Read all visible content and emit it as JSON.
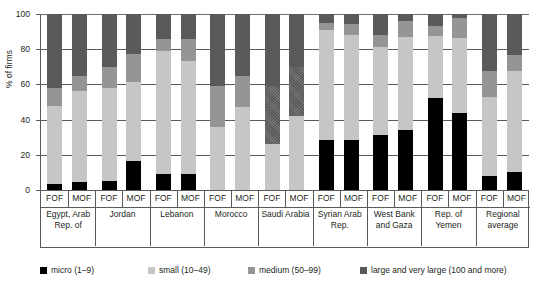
{
  "title_fragment": "...",
  "axis": {
    "ylabel": "% of firms",
    "yticks": [
      "0",
      "20",
      "40",
      "60",
      "80",
      "100"
    ],
    "ymin": 0,
    "ymax": 100
  },
  "subcategory_labels": [
    "FOF",
    "MOF"
  ],
  "legend": [
    {
      "label": "micro (1–9)",
      "color": "#000000"
    },
    {
      "label": "small (10–49)",
      "color": "#c6c6c6"
    },
    {
      "label": "medium (50–99)",
      "color": "#959595"
    },
    {
      "label": "large and very large (100 and more)",
      "color": "#5a5a5a"
    }
  ],
  "chart_data": {
    "type": "bar",
    "subtype": "stacked-grouped",
    "title": "",
    "xlabel": "",
    "ylabel": "% of firms",
    "ylim": [
      0,
      100
    ],
    "grid": true,
    "legend_position": "bottom",
    "ytick_values": [
      0,
      20,
      40,
      60,
      80,
      100
    ],
    "categories": [
      "Egypt, Arab Rep. of",
      "Jordan",
      "Lebanon",
      "Morocco",
      "Saudi Arabia",
      "Syrian Arab Rep.",
      "West Bank and Gaza",
      "Rep. of Yemen",
      "Regional average"
    ],
    "subcategories": [
      "FOF",
      "MOF"
    ],
    "series": [
      {
        "name": "micro (1–9)",
        "color": "#000000",
        "values": {
          "FOF": [
            3.5,
            5.0,
            9.0,
            0.0,
            0.0,
            28.5,
            31.5,
            52.0,
            8.0
          ],
          "MOF": [
            4.5,
            16.5,
            9.0,
            0.0,
            0.0,
            28.5,
            34.0,
            43.5,
            10.5
          ]
        }
      },
      {
        "name": "small (10–49)",
        "color": "#c6c6c6",
        "values": {
          "FOF": [
            44.5,
            53.0,
            70.0,
            36.0,
            26.0,
            62.5,
            50.0,
            35.5,
            45.0
          ],
          "MOF": [
            52.0,
            45.0,
            64.5,
            47.0,
            42.0,
            59.5,
            53.0,
            43.0,
            57.0
          ]
        }
      },
      {
        "name": "medium (50–99)",
        "color": "#959595",
        "values": {
          "FOF": [
            10.0,
            12.0,
            7.0,
            23.0,
            33.0,
            4.0,
            6.5,
            5.5,
            14.5
          ],
          "MOF": [
            8.0,
            15.5,
            12.5,
            18.0,
            28.0,
            6.5,
            9.0,
            11.0,
            9.0
          ]
        }
      },
      {
        "name": "large and very large (100 and more)",
        "color": "#5a5a5a",
        "values": {
          "FOF": [
            42.0,
            30.0,
            14.0,
            41.0,
            41.0,
            5.0,
            12.0,
            7.0,
            32.5
          ],
          "MOF": [
            35.5,
            23.0,
            14.0,
            35.0,
            30.0,
            5.5,
            4.0,
            2.5,
            23.5
          ]
        }
      }
    ],
    "cumulative_tops": {
      "FOF": {
        "micro": [
          3.5,
          5.0,
          9.0,
          0.0,
          0.0,
          28.5,
          31.5,
          52.0,
          8.0
        ],
        "small": [
          48.0,
          58.0,
          79.0,
          36.0,
          26.0,
          91.0,
          81.5,
          87.5,
          53.0
        ],
        "medium": [
          58.0,
          70.0,
          86.0,
          59.0,
          59.0,
          95.0,
          88.0,
          93.0,
          67.5
        ],
        "large": [
          100,
          100,
          100,
          100,
          100,
          100,
          100,
          100,
          100
        ]
      },
      "MOF": {
        "micro": [
          4.5,
          16.5,
          9.0,
          0.0,
          0.0,
          28.5,
          34.0,
          43.5,
          10.5
        ],
        "small": [
          56.5,
          61.5,
          73.5,
          47.0,
          42.0,
          88.0,
          87.0,
          86.5,
          67.5
        ],
        "medium": [
          64.5,
          77.0,
          86.0,
          65.0,
          70.0,
          94.5,
          96.0,
          97.5,
          76.5
        ],
        "large": [
          100,
          100,
          100,
          100,
          100,
          100,
          100,
          100,
          100
        ]
      }
    }
  }
}
